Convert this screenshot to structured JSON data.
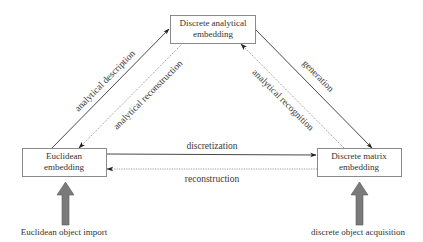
{
  "nodes": {
    "top": {
      "line1": "Discrete analytical",
      "line2": "embedding"
    },
    "left": {
      "line1": "Euclidean",
      "line2": "embedding"
    },
    "right": {
      "line1": "Discrete matrix",
      "line2": "embedding"
    }
  },
  "edges": {
    "analytical_description": "analytical description",
    "analytical_reconstruction": "analytical reconstruction",
    "generation": "generation",
    "analytical_recognition": "analytical recognition",
    "discretization": "discretization",
    "reconstruction": "reconstruction"
  },
  "inputs": {
    "left": "Euclidean object import",
    "right": "discrete object acquisition"
  },
  "colors": {
    "solid_arrow": "#333333",
    "dotted_arrow": "#9a9a9a",
    "box_border": "#8a8a8a",
    "input_arrow": "#7a7a7a"
  }
}
